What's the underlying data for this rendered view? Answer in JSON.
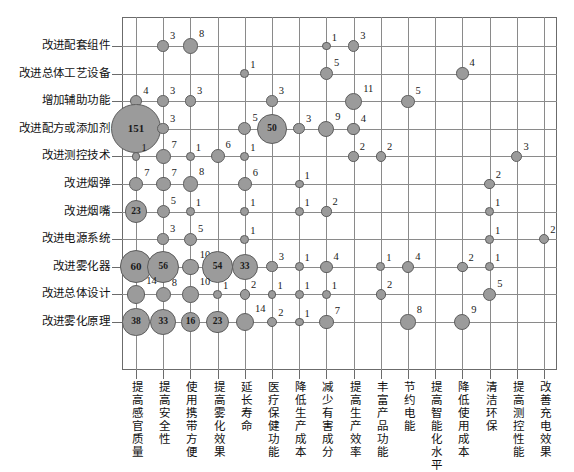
{
  "chart_data": {
    "type": "scatter",
    "title": "",
    "subtitle": "",
    "xlabel": "",
    "ylabel": "",
    "legend": [],
    "grid": true,
    "bubble_color": "#9b9b9b",
    "bubble_border_color": "#5d5d5d",
    "frame_color": "#6b6b6b",
    "grid_color": "#8a8a8a",
    "categories_x": [
      "提高感官质量",
      "提高安全性",
      "使用携带方便",
      "提高雾化效果",
      "延长寿命",
      "医疗保健功能",
      "降低生产成本",
      "减少有害成分",
      "提高生产效率",
      "丰富产品功能",
      "节约电能",
      "提高智能化水平",
      "降低使用成本",
      "清洁环保",
      "提高测控性能",
      "改善充电效果"
    ],
    "categories_y": [
      "改进配套组件",
      "改进总体工艺设备",
      "增加辅助功能",
      "改进配方或添加剂",
      "改进测控技术",
      "改进烟弹",
      "改进烟嘴",
      "改进电源系统",
      "改进雾化器",
      "改进总体设计",
      "改进雾化原理"
    ],
    "value_range": [
      1,
      151
    ],
    "points": [
      {
        "row": 0,
        "col": 1,
        "value": 3
      },
      {
        "row": 0,
        "col": 2,
        "value": 8
      },
      {
        "row": 0,
        "col": 7,
        "value": 1
      },
      {
        "row": 0,
        "col": 8,
        "value": 3
      },
      {
        "row": 1,
        "col": 4,
        "value": 1
      },
      {
        "row": 1,
        "col": 7,
        "value": 5
      },
      {
        "row": 1,
        "col": 12,
        "value": 4
      },
      {
        "row": 2,
        "col": 0,
        "value": 4
      },
      {
        "row": 2,
        "col": 1,
        "value": 3
      },
      {
        "row": 2,
        "col": 2,
        "value": 3
      },
      {
        "row": 2,
        "col": 5,
        "value": 3
      },
      {
        "row": 2,
        "col": 8,
        "value": 11
      },
      {
        "row": 2,
        "col": 10,
        "value": 5
      },
      {
        "row": 3,
        "col": 0,
        "value": 151
      },
      {
        "row": 3,
        "col": 1,
        "value": 3
      },
      {
        "row": 3,
        "col": 4,
        "value": 5
      },
      {
        "row": 3,
        "col": 5,
        "value": 50
      },
      {
        "row": 3,
        "col": 6,
        "value": 3
      },
      {
        "row": 3,
        "col": 7,
        "value": 9
      },
      {
        "row": 3,
        "col": 8,
        "value": 4
      },
      {
        "row": 4,
        "col": 0,
        "value": 1
      },
      {
        "row": 4,
        "col": 1,
        "value": 7
      },
      {
        "row": 4,
        "col": 2,
        "value": 1
      },
      {
        "row": 4,
        "col": 3,
        "value": 6
      },
      {
        "row": 4,
        "col": 4,
        "value": 1
      },
      {
        "row": 4,
        "col": 8,
        "value": 2
      },
      {
        "row": 4,
        "col": 9,
        "value": 2
      },
      {
        "row": 4,
        "col": 14,
        "value": 3
      },
      {
        "row": 5,
        "col": 0,
        "value": 7
      },
      {
        "row": 5,
        "col": 1,
        "value": 7
      },
      {
        "row": 5,
        "col": 2,
        "value": 8
      },
      {
        "row": 5,
        "col": 4,
        "value": 6
      },
      {
        "row": 5,
        "col": 6,
        "value": 1
      },
      {
        "row": 5,
        "col": 13,
        "value": 2
      },
      {
        "row": 6,
        "col": 0,
        "value": 23
      },
      {
        "row": 6,
        "col": 1,
        "value": 5
      },
      {
        "row": 6,
        "col": 2,
        "value": 1
      },
      {
        "row": 6,
        "col": 4,
        "value": 1
      },
      {
        "row": 6,
        "col": 6,
        "value": 1
      },
      {
        "row": 6,
        "col": 7,
        "value": 2
      },
      {
        "row": 6,
        "col": 13,
        "value": 1
      },
      {
        "row": 7,
        "col": 1,
        "value": 3
      },
      {
        "row": 7,
        "col": 2,
        "value": 5
      },
      {
        "row": 7,
        "col": 4,
        "value": 1
      },
      {
        "row": 7,
        "col": 13,
        "value": 1
      },
      {
        "row": 7,
        "col": 15,
        "value": 2
      },
      {
        "row": 8,
        "col": 0,
        "value": 60
      },
      {
        "row": 8,
        "col": 1,
        "value": 56
      },
      {
        "row": 8,
        "col": 2,
        "value": 10
      },
      {
        "row": 8,
        "col": 3,
        "value": 54
      },
      {
        "row": 8,
        "col": 4,
        "value": 33
      },
      {
        "row": 8,
        "col": 5,
        "value": 3
      },
      {
        "row": 8,
        "col": 6,
        "value": 1
      },
      {
        "row": 8,
        "col": 7,
        "value": 4
      },
      {
        "row": 8,
        "col": 9,
        "value": 1
      },
      {
        "row": 8,
        "col": 10,
        "value": 4
      },
      {
        "row": 8,
        "col": 12,
        "value": 2
      },
      {
        "row": 8,
        "col": 13,
        "value": 1
      },
      {
        "row": 9,
        "col": 0,
        "value": 14
      },
      {
        "row": 9,
        "col": 1,
        "value": 8
      },
      {
        "row": 9,
        "col": 2,
        "value": 10
      },
      {
        "row": 9,
        "col": 3,
        "value": 1
      },
      {
        "row": 9,
        "col": 4,
        "value": 2
      },
      {
        "row": 9,
        "col": 5,
        "value": 1
      },
      {
        "row": 9,
        "col": 6,
        "value": 1
      },
      {
        "row": 9,
        "col": 7,
        "value": 1
      },
      {
        "row": 9,
        "col": 9,
        "value": 2
      },
      {
        "row": 9,
        "col": 13,
        "value": 5
      },
      {
        "row": 10,
        "col": 0,
        "value": 38
      },
      {
        "row": 10,
        "col": 1,
        "value": 33
      },
      {
        "row": 10,
        "col": 2,
        "value": 16
      },
      {
        "row": 10,
        "col": 3,
        "value": 23
      },
      {
        "row": 10,
        "col": 4,
        "value": 14
      },
      {
        "row": 10,
        "col": 5,
        "value": 2
      },
      {
        "row": 10,
        "col": 6,
        "value": 1
      },
      {
        "row": 10,
        "col": 7,
        "value": 7
      },
      {
        "row": 10,
        "col": 10,
        "value": 8
      },
      {
        "row": 10,
        "col": 12,
        "value": 9
      }
    ]
  },
  "layout": {
    "plot_left": 122,
    "plot_top": 17,
    "plot_right": 557,
    "plot_bottom": 370,
    "col_count": 16,
    "row_count": 11,
    "col_step": 27.2,
    "row_step": 27.6,
    "col_first": 136,
    "row_first": 46
  }
}
